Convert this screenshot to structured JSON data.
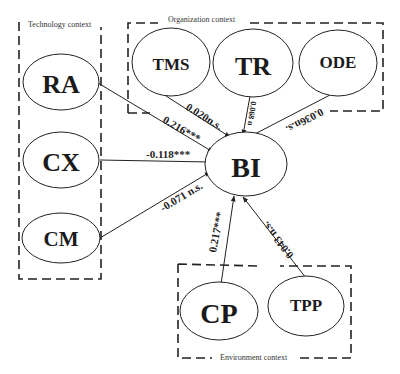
{
  "diagram": {
    "groups": [
      {
        "id": "technology",
        "label": "Technology context"
      },
      {
        "id": "organization",
        "label": "Organization context"
      },
      {
        "id": "environment",
        "label": "Environment context"
      }
    ],
    "nodes": [
      {
        "id": "RA",
        "label": "RA",
        "group": "technology"
      },
      {
        "id": "CX",
        "label": "CX",
        "group": "technology"
      },
      {
        "id": "CM",
        "label": "CM",
        "group": "technology"
      },
      {
        "id": "TMS",
        "label": "TMS",
        "group": "organization"
      },
      {
        "id": "TR",
        "label": "TR",
        "group": "organization"
      },
      {
        "id": "ODE",
        "label": "ODE",
        "group": "organization"
      },
      {
        "id": "CP",
        "label": "CP",
        "group": "environment"
      },
      {
        "id": "TPP",
        "label": "TPP",
        "group": "environment"
      },
      {
        "id": "BI",
        "label": "BI",
        "group": null
      }
    ],
    "edges": [
      {
        "from": "RA",
        "to": "BI",
        "label": "0.216***"
      },
      {
        "from": "CX",
        "to": "BI",
        "label": "-0.118***"
      },
      {
        "from": "CM",
        "to": "BI",
        "label": "-0.071 n.s."
      },
      {
        "from": "TMS",
        "to": "BI",
        "label": "0.020n.s."
      },
      {
        "from": "TR",
        "to": "BI",
        "label": "0.068 n"
      },
      {
        "from": "ODE",
        "to": "BI",
        "label": "0.036n.s."
      },
      {
        "from": "CP",
        "to": "BI",
        "label": "0.217***"
      },
      {
        "from": "TPP",
        "to": "BI",
        "label": "0.043 n.s."
      }
    ]
  }
}
